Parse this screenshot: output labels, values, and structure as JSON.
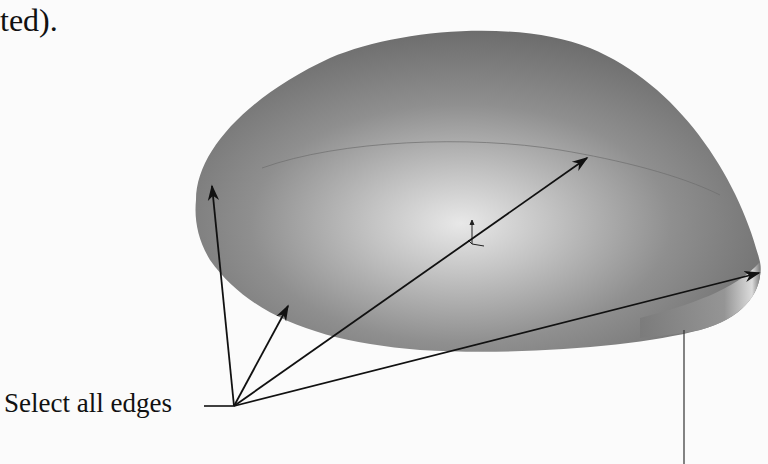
{
  "page": {
    "top_text_fragment": "ted).",
    "figure": {
      "description": "Shaded 3D dome surface (CAD model) with callout arrows",
      "callout_label": "Select all edges",
      "colors": {
        "background": "#fbfbfb",
        "surface_dark": "#6a6a6a",
        "surface_mid": "#8e8e8e",
        "surface_highlight": "#e6e6e6",
        "arrow": "#111111"
      },
      "callout_origin": [
        234,
        406
      ],
      "arrow_targets": [
        [
          212,
          185
        ],
        [
          288,
          305
        ],
        [
          588,
          157
        ],
        [
          760,
          273
        ]
      ],
      "icons": [
        "origin-triad-icon"
      ]
    }
  }
}
